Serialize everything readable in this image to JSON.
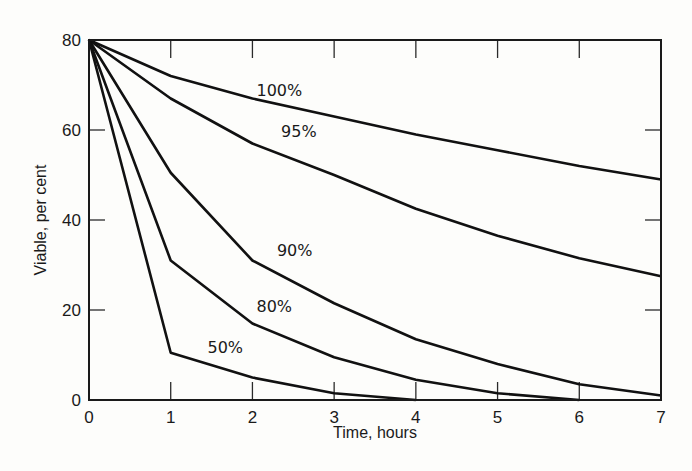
{
  "chart_data": {
    "type": "line",
    "title": "",
    "xlabel": "Time, hours",
    "ylabel": "Viable, per cent",
    "xlim": [
      0,
      7
    ],
    "ylim": [
      0,
      80
    ],
    "x_ticks": [
      0,
      1,
      2,
      3,
      4,
      5,
      6,
      7
    ],
    "y_ticks": [
      0,
      20,
      40,
      60,
      80
    ],
    "grid": false,
    "legend": "inline labels on curves",
    "x": [
      0,
      1,
      2,
      3,
      4,
      5,
      6,
      7
    ],
    "series": [
      {
        "name": "100%",
        "values": [
          80,
          72,
          67,
          63,
          59,
          55.5,
          52,
          49
        ],
        "label_pos": [
          2.05,
          67.5
        ]
      },
      {
        "name": "95%",
        "values": [
          80,
          67,
          57,
          50,
          42.5,
          36.5,
          31.5,
          27.5
        ],
        "label_pos": [
          2.35,
          58.5
        ]
      },
      {
        "name": "90%",
        "values": [
          80,
          50.5,
          31,
          21.5,
          13.5,
          8,
          3.5,
          1
        ],
        "label_pos": [
          2.3,
          32
        ]
      },
      {
        "name": "80%",
        "values": [
          80,
          31,
          17,
          9.5,
          4.5,
          1.5,
          0,
          null
        ],
        "label_pos": [
          2.05,
          19.5
        ]
      },
      {
        "name": "50%",
        "values": [
          80,
          10.5,
          5,
          1.5,
          0,
          null,
          null,
          null
        ],
        "label_pos": [
          1.45,
          10.5
        ]
      }
    ]
  }
}
